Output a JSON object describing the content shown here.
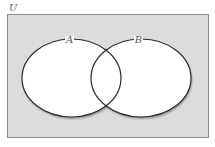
{
  "diagram": {
    "type": "venn",
    "universe_label": "U",
    "sets": [
      {
        "label": "A"
      },
      {
        "label": "B"
      }
    ],
    "colors": {
      "universe_fill": "#dcdcdc",
      "universe_stroke": "#8a8a8a",
      "set_fill": "#ffffff",
      "set_stroke": "#2a2a2a",
      "label_color": "#555555"
    }
  }
}
